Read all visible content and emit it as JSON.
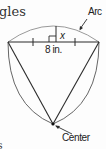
{
  "page": {
    "heading_fragment": "gles",
    "bottom_fragment": "s"
  },
  "diagram": {
    "type": "circle-sector-chord",
    "labels": {
      "arc": "Arc",
      "segment_height": "x",
      "chord_length": "8 in.",
      "center": "Center"
    },
    "colors": {
      "stroke": "#2a2a2a",
      "arc_stroke": "#9a9a9a",
      "text": "#222222"
    },
    "elements": [
      "chord",
      "arc",
      "perpendicular-bisector",
      "right-angle-mark",
      "congruence-tick-marks",
      "radius-lines",
      "center-point"
    ]
  }
}
